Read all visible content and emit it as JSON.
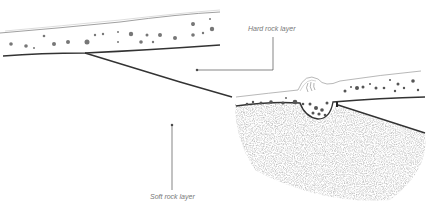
{
  "diagram": {
    "labels": {
      "hard_rock": "Hard rock layer",
      "soft_rock": "Soft rock layer"
    },
    "colors": {
      "line": "#333333",
      "label": "#777777",
      "stipple": "#999999"
    }
  }
}
